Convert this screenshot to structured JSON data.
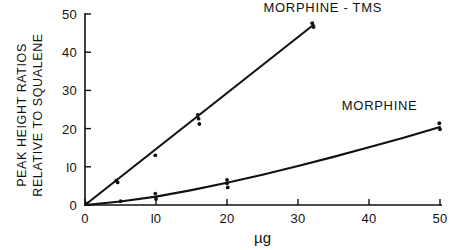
{
  "chart_data": {
    "type": "scatter",
    "title": "",
    "xlabel": "µg",
    "ylabel": "PEAK HEIGHT RATIOS RELATIVE TO SQUALENE",
    "ylabel_lines": [
      "PEAK HEIGHT RATIOS",
      "RELATIVE TO SQUALENE"
    ],
    "xlim": [
      0,
      50
    ],
    "ylim": [
      0,
      50
    ],
    "xticks": [
      0,
      10,
      20,
      30,
      40,
      50
    ],
    "yticks": [
      0,
      10,
      20,
      30,
      40,
      50
    ],
    "xtick_labels": [
      "0",
      "l0",
      "20",
      "30",
      "40",
      "50"
    ],
    "ytick_labels": [
      "0",
      "l0",
      "20",
      "30",
      "40",
      "50"
    ],
    "grid": false,
    "legend_position": "inline-annotation",
    "line_color": "#111111",
    "marker_color": "#111111",
    "background": "#ffffff",
    "series": [
      {
        "name": "MORPHINE-TMS",
        "label": "MORPHINE - TMS",
        "label_x": 33.5,
        "label_y": 50.5,
        "fit_x": [
          0,
          32.2
        ],
        "fit_y": [
          0,
          47.2
        ],
        "points": [
          {
            "x": 0.2,
            "y": 0.4
          },
          {
            "x": 4.4,
            "y": 6.4
          },
          {
            "x": 4.6,
            "y": 5.9
          },
          {
            "x": 9.9,
            "y": 13.0
          },
          {
            "x": 15.9,
            "y": 23.6
          },
          {
            "x": 16.0,
            "y": 22.6
          },
          {
            "x": 16.1,
            "y": 21.2
          },
          {
            "x": 32.0,
            "y": 47.6
          },
          {
            "x": 32.2,
            "y": 46.6
          }
        ]
      },
      {
        "name": "MORPHINE",
        "label": "MORPHINE",
        "label_x": 41.5,
        "label_y": 24.8,
        "fit_x": [
          0,
          5,
          10,
          15,
          20,
          25,
          30,
          35,
          40,
          45,
          50
        ],
        "fit_y": [
          0,
          0.9,
          2.2,
          3.9,
          5.8,
          7.9,
          10.2,
          12.6,
          15.1,
          17.7,
          20.4
        ],
        "points": [
          {
            "x": 0.2,
            "y": 0.3
          },
          {
            "x": 5.0,
            "y": 1.0
          },
          {
            "x": 9.9,
            "y": 3.0
          },
          {
            "x": 10.0,
            "y": 1.6
          },
          {
            "x": 20.0,
            "y": 6.6
          },
          {
            "x": 20.0,
            "y": 5.7
          },
          {
            "x": 20.1,
            "y": 4.6
          },
          {
            "x": 49.9,
            "y": 21.4
          },
          {
            "x": 50.0,
            "y": 19.8
          }
        ]
      }
    ]
  }
}
